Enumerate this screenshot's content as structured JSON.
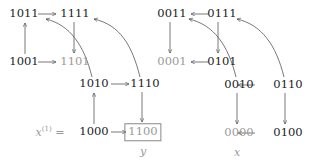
{
  "left_graph": {
    "nodes": [
      {
        "id": "1011",
        "label": "1011",
        "style": "normal"
      },
      {
        "id": "1111",
        "label": "1111",
        "style": "normal"
      },
      {
        "id": "1001",
        "label": "1001",
        "style": "normal"
      },
      {
        "id": "1101",
        "label": "1101",
        "style": "gray"
      },
      {
        "id": "1010",
        "label": "1010",
        "style": "normal"
      },
      {
        "id": "1110",
        "label": "1110",
        "style": "normal"
      },
      {
        "id": "1000",
        "label": "1000",
        "style": "normal"
      },
      {
        "id": "1100",
        "label": "1100",
        "style": "gray-boxed"
      }
    ],
    "edges": [
      {
        "from": "1011",
        "to": "1111",
        "type": "straight"
      },
      {
        "from": "1001",
        "to": "1011",
        "type": "straight"
      },
      {
        "from": "1001",
        "to": "1101",
        "type": "straight"
      },
      {
        "from": "1111",
        "to": "1101",
        "type": "straight"
      },
      {
        "from": "1010",
        "to": "1110",
        "type": "straight"
      },
      {
        "from": "1000",
        "to": "1010",
        "type": "straight"
      },
      {
        "from": "1000",
        "to": "1100",
        "type": "straight"
      },
      {
        "from": "1110",
        "to": "1100",
        "type": "straight"
      },
      {
        "from": "1010",
        "to": "1011",
        "type": "curved"
      },
      {
        "from": "1110",
        "to": "1111",
        "type": "curved"
      }
    ],
    "start_label": "x",
    "start_superscript": "(1)",
    "start_suffix": " =",
    "target_label": "y"
  },
  "right_graph": {
    "nodes": [
      {
        "id": "0011",
        "label": "0011",
        "style": "normal"
      },
      {
        "id": "0111",
        "label": "0111",
        "style": "normal"
      },
      {
        "id": "0001",
        "label": "0001",
        "style": "gray"
      },
      {
        "id": "0101",
        "label": "0101",
        "style": "normal"
      },
      {
        "id": "0010",
        "label": "0010",
        "style": "normal"
      },
      {
        "id": "0110",
        "label": "0110",
        "style": "normal"
      },
      {
        "id": "0000",
        "label": "0000",
        "style": "gray"
      },
      {
        "id": "0100",
        "label": "0100",
        "style": "normal"
      }
    ],
    "edges": [
      {
        "from": "0111",
        "to": "0011",
        "type": "straight"
      },
      {
        "from": "0011",
        "to": "0001",
        "type": "straight"
      },
      {
        "from": "0101",
        "to": "0001",
        "type": "straight"
      },
      {
        "from": "0111",
        "to": "0101",
        "type": "straight"
      },
      {
        "from": "0110",
        "to": "0010",
        "type": "straight"
      },
      {
        "from": "0010",
        "to": "0000",
        "type": "straight"
      },
      {
        "from": "0100",
        "to": "0000",
        "type": "straight"
      },
      {
        "from": "0110",
        "to": "0100",
        "type": "straight"
      },
      {
        "from": "0010",
        "to": "0011",
        "type": "curved"
      },
      {
        "from": "0110",
        "to": "0111",
        "type": "curved"
      }
    ],
    "target_label": "x"
  },
  "colors": {
    "normal": "#1a1a1a",
    "gray": "#9a9a9a",
    "edge": "#555555"
  }
}
